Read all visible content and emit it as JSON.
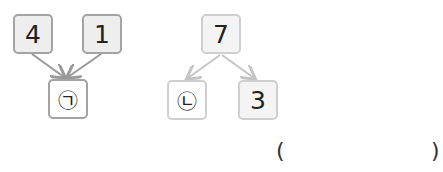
{
  "diagram_left": {
    "type": "combine",
    "top_left": "4",
    "top_right": "1",
    "bottom": "㉠"
  },
  "diagram_right": {
    "type": "split",
    "top": "7",
    "bottom_left": "㉡",
    "bottom_right": "3"
  },
  "answer": {
    "open_paren": "(",
    "close_paren": ")",
    "value": ""
  },
  "colors": {
    "left_border": "#a3a3a3",
    "right_border": "#cfcfcf",
    "box_fill": "#eeeeee",
    "arrow_left": "#999999",
    "arrow_right": "#c4c4c4"
  }
}
